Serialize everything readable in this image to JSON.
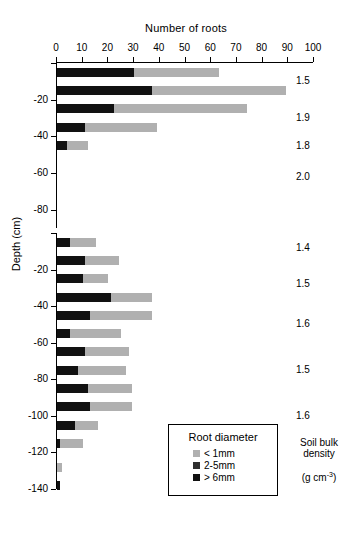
{
  "chart_data": {
    "type": "bar",
    "orientation": "horizontal",
    "stacked": true,
    "title": "",
    "xlabel": "Number of roots",
    "ylabel": "Depth (cm)",
    "xlim": [
      0,
      100
    ],
    "xticks": [
      0,
      10,
      20,
      30,
      40,
      50,
      60,
      70,
      80,
      90,
      100
    ],
    "grid": false,
    "legend": {
      "title": "Root diameter",
      "position": "inside-bottom-right",
      "entries": [
        {
          "label": "< 1mm",
          "color": "#b0b0b0"
        },
        {
          "label": "2-5mm",
          "color": "#2e2e2e"
        },
        {
          "label": "> 6mm",
          "color": "#111111"
        }
      ]
    },
    "secondary_axis": {
      "title_lines": [
        "Soil bulk",
        "density"
      ],
      "units": "(g cm",
      "units_sup": "-3",
      "units_tail": ")"
    },
    "panels": [
      {
        "name": "upper",
        "yticks": [
          0,
          -20,
          -40,
          -60,
          -80
        ],
        "ytick_labels": [
          "",
          "-20",
          "-40",
          "-60",
          "-80"
        ],
        "ylim": [
          -90,
          0
        ],
        "bars": [
          {
            "depth": -5,
            "gt6mm": 30,
            "d2to5mm": 0,
            "lt1mm": 33,
            "total": 63
          },
          {
            "depth": -15,
            "gt6mm": 37,
            "d2to5mm": 0,
            "lt1mm": 52,
            "total": 89
          },
          {
            "depth": -25,
            "gt6mm": 22,
            "d2to5mm": 0,
            "lt1mm": 52,
            "total": 74
          },
          {
            "depth": -35,
            "gt6mm": 11,
            "d2to5mm": 0,
            "lt1mm": 28,
            "total": 39
          },
          {
            "depth": -45,
            "gt6mm": 4,
            "d2to5mm": 0,
            "lt1mm": 8,
            "total": 12
          },
          {
            "depth": -55,
            "gt6mm": 0,
            "d2to5mm": 0,
            "lt1mm": 0,
            "total": 0
          },
          {
            "depth": -65,
            "gt6mm": 0,
            "d2to5mm": 0,
            "lt1mm": 0,
            "total": 0
          },
          {
            "depth": -75,
            "gt6mm": 0,
            "d2to5mm": 0,
            "lt1mm": 0,
            "total": 0
          },
          {
            "depth": -85,
            "gt6mm": 0,
            "d2to5mm": 0,
            "lt1mm": 0,
            "total": 0
          }
        ],
        "densities": [
          {
            "depth": -10,
            "value": "1.5"
          },
          {
            "depth": -30,
            "value": "1.9"
          },
          {
            "depth": -45,
            "value": "1.8"
          },
          {
            "depth": -62,
            "value": "2.0"
          }
        ]
      },
      {
        "name": "lower",
        "yticks": [
          0,
          -20,
          -40,
          -60,
          -80,
          -100,
          -120,
          -140
        ],
        "ytick_labels": [
          "",
          "-20",
          "-40",
          "-60",
          "-80",
          "-100",
          "-120",
          "-140"
        ],
        "ylim": [
          -140,
          0
        ],
        "bars": [
          {
            "depth": -5,
            "gt6mm": 5,
            "d2to5mm": 0,
            "lt1mm": 10,
            "total": 15
          },
          {
            "depth": -15,
            "gt6mm": 11,
            "d2to5mm": 0,
            "lt1mm": 13,
            "total": 24
          },
          {
            "depth": -25,
            "gt6mm": 10,
            "d2to5mm": 0,
            "lt1mm": 10,
            "total": 20
          },
          {
            "depth": -35,
            "gt6mm": 21,
            "d2to5mm": 0,
            "lt1mm": 16,
            "total": 37
          },
          {
            "depth": -45,
            "gt6mm": 13,
            "d2to5mm": 0,
            "lt1mm": 24,
            "total": 37
          },
          {
            "depth": -55,
            "gt6mm": 5,
            "d2to5mm": 0,
            "lt1mm": 20,
            "total": 25
          },
          {
            "depth": -65,
            "gt6mm": 11,
            "d2to5mm": 0,
            "lt1mm": 17,
            "total": 28
          },
          {
            "depth": -75,
            "gt6mm": 8,
            "d2to5mm": 0,
            "lt1mm": 19,
            "total": 27
          },
          {
            "depth": -85,
            "gt6mm": 12,
            "d2to5mm": 0,
            "lt1mm": 17,
            "total": 29
          },
          {
            "depth": -95,
            "gt6mm": 13,
            "d2to5mm": 0,
            "lt1mm": 16,
            "total": 29
          },
          {
            "depth": -105,
            "gt6mm": 7,
            "d2to5mm": 0,
            "lt1mm": 9,
            "total": 16
          },
          {
            "depth": -115,
            "gt6mm": 1,
            "d2to5mm": 0,
            "lt1mm": 9,
            "total": 10
          },
          {
            "depth": -128,
            "gt6mm": 0,
            "d2to5mm": 0,
            "lt1mm": 2,
            "total": 2
          },
          {
            "depth": -138,
            "gt6mm": 1,
            "d2to5mm": 0,
            "lt1mm": 0,
            "total": 1
          }
        ],
        "densities": [
          {
            "depth": -8,
            "value": "1.4"
          },
          {
            "depth": -28,
            "value": "1.5"
          },
          {
            "depth": -50,
            "value": "1.6"
          },
          {
            "depth": -75,
            "value": "1.5"
          },
          {
            "depth": -100,
            "value": "1.6"
          }
        ]
      }
    ]
  }
}
